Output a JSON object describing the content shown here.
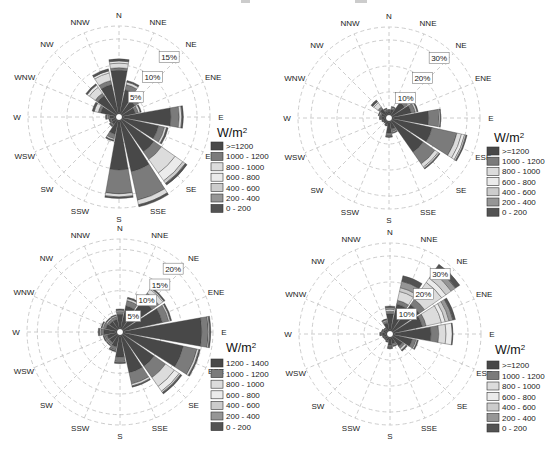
{
  "figure": {
    "width": 547,
    "height": 452,
    "background": "#ffffff"
  },
  "directions": [
    "N",
    "NNE",
    "NE",
    "ENE",
    "E",
    "ESE",
    "SE",
    "SSE",
    "S",
    "SSW",
    "SW",
    "WSW",
    "W",
    "WNW",
    "NW",
    "NNW"
  ],
  "style": {
    "bin_colors": [
      "#484848",
      "#7b7b7b",
      "#dcdcdc",
      "#ebebeb",
      "#cccccc",
      "#969696",
      "#535353"
    ],
    "grid_color": "#c6c6c6",
    "petal_stroke": "#3a3a3a",
    "text_color": "#222222",
    "ring_label_box_border": "#666666",
    "center_dot_fill": "#ffffff",
    "center_dot_stroke": "#333333"
  },
  "chart_data": [
    {
      "type": "windrose",
      "position": "top-left",
      "units": "W/m2",
      "center_px": [
        119,
        117
      ],
      "outer_radius_px": 91,
      "outer_pct": 17.5,
      "rings_pct": [
        5,
        10,
        15
      ],
      "ring_labels": [
        "5%",
        "10%",
        "15%"
      ],
      "ring_label_azimuth_deg": 40,
      "legend": {
        "title": "W/m",
        "title_sup": "2",
        "swatch_x": 211,
        "title_x": 217,
        "title_y": 137,
        "rows_y0": 146,
        "row_h": 10.4,
        "bins": [
          ">=1200",
          "1000 - 1200",
          "800 - 1000",
          "600 - 800",
          "400 - 600",
          "200 - 400",
          "0 - 200"
        ]
      },
      "petals_pct": {
        "N": [
          8.6,
          0.5,
          0.9,
          0.4,
          0,
          0,
          0.4
        ],
        "NNE": [
          5.0,
          1.0,
          0.5,
          0,
          0,
          0,
          0.3
        ],
        "NE": [
          3.4,
          0.8,
          0.6,
          0,
          0,
          0,
          0.3
        ],
        "ENE": [
          2.8,
          0.6,
          0.4,
          0,
          0,
          0,
          0.2
        ],
        "E": [
          9.6,
          1.6,
          0.5,
          0,
          0,
          0,
          0.3
        ],
        "ESE": [
          7.4,
          1.2,
          0.4,
          0,
          0,
          0,
          0.3
        ],
        "SE": [
          7.8,
          1.8,
          3.2,
          1.8,
          0.6,
          0,
          0.4
        ],
        "SSE": [
          10.4,
          5.6,
          0.9,
          0,
          0,
          0,
          0.4
        ],
        "S": [
          9.8,
          4.6,
          0.6,
          0,
          0,
          0,
          0.3
        ],
        "SSW": [
          3.0,
          0.9,
          0.3,
          0,
          0,
          0,
          0.2
        ],
        "SW": [
          1.3,
          0.4,
          0,
          0,
          0,
          0,
          0.2
        ],
        "WSW": [
          1.1,
          0.3,
          0,
          0,
          0,
          0,
          0.2
        ],
        "W": [
          1.4,
          0.4,
          0.2,
          0,
          0,
          0,
          0.2
        ],
        "WNW": [
          3.2,
          0.5,
          0.8,
          0,
          0,
          0,
          0.4
        ],
        "NW": [
          4.6,
          0.6,
          1.4,
          0.5,
          0,
          0,
          0.3
        ],
        "NNW": [
          6.0,
          0.8,
          1.5,
          0.4,
          0,
          0,
          0.4
        ]
      }
    },
    {
      "type": "windrose",
      "position": "top-right",
      "units": "W/m2",
      "center_px": [
        389,
        118
      ],
      "outer_radius_px": 91,
      "outer_pct": 35,
      "rings_pct": [
        10,
        20,
        30
      ],
      "ring_labels": [
        "10%",
        "20%",
        "30%"
      ],
      "ring_label_azimuth_deg": 40,
      "legend": {
        "title": "W/m",
        "title_sup": "2",
        "swatch_x": 487,
        "title_x": 494,
        "title_y": 142,
        "rows_y0": 151,
        "row_h": 10.2,
        "bins": [
          ">=1200",
          "1000 - 1200",
          "800 - 1000",
          "600 - 800",
          "400 - 600",
          "200 - 400",
          "0 - 200"
        ]
      },
      "petals_pct": {
        "N": [
          1.8,
          0.4,
          0,
          0,
          0,
          0,
          0.3
        ],
        "NNE": [
          2.6,
          0.6,
          0.3,
          0,
          0,
          0,
          0.3
        ],
        "NE": [
          6.5,
          1.5,
          1.0,
          0,
          0,
          0,
          0.5
        ],
        "ENE": [
          8.0,
          1.6,
          0.7,
          0,
          0,
          0,
          0.4
        ],
        "E": [
          14.5,
          4.0,
          0.5,
          0,
          0,
          0,
          0.2
        ],
        "ESE": [
          16.2,
          9.8,
          1.8,
          1.2,
          0.6,
          0,
          0.4
        ],
        "SE": [
          15.3,
          5.5,
          1.5,
          0.5,
          0,
          0,
          0.4
        ],
        "SSE": [
          3.6,
          1.0,
          0.4,
          0,
          0,
          0,
          0.3
        ],
        "S": [
          5.0,
          1.2,
          0.2,
          0,
          0,
          0,
          0.3
        ],
        "SSW": [
          1.7,
          0.4,
          0,
          0,
          0,
          0,
          0.3
        ],
        "SW": [
          1.3,
          0.3,
          0,
          0,
          0,
          0,
          0.2
        ],
        "WSW": [
          1.5,
          0.4,
          0,
          0,
          0,
          0,
          0.2
        ],
        "W": [
          1.9,
          0.5,
          0.2,
          0,
          0,
          0,
          0.3
        ],
        "WNW": [
          2.2,
          0.6,
          0.4,
          0,
          0,
          0,
          0.3
        ],
        "NW": [
          3.4,
          1.0,
          2.0,
          0.5,
          0,
          0,
          0.8
        ],
        "NNW": [
          2.0,
          0.5,
          0.3,
          0,
          0,
          0,
          0.3
        ]
      }
    },
    {
      "type": "windrose",
      "position": "bottom-left",
      "units": "W/m2",
      "center_px": [
        120,
        332
      ],
      "outer_radius_px": 93,
      "outer_pct": 22.5,
      "rings_pct": [
        5,
        10,
        15,
        20
      ],
      "ring_labels": [
        "5%",
        "10%",
        "15%",
        "20%"
      ],
      "ring_label_azimuth_deg": 40,
      "legend": {
        "title": "W/m",
        "title_sup": "2",
        "swatch_x": 211,
        "title_x": 226,
        "title_y": 352,
        "rows_y0": 363,
        "row_h": 10.6,
        "bins": [
          "1200 - 1400",
          "1000 - 1200",
          "800 - 1000",
          "600 - 800",
          "400 - 600",
          "200 - 400",
          "0 - 200"
        ]
      },
      "petals_pct": {
        "N": [
          3.8,
          0.7,
          0.3,
          0,
          0,
          0,
          0.3
        ],
        "NNE": [
          6.0,
          1.3,
          0.5,
          0,
          0,
          0,
          0.3
        ],
        "NE": [
          9.0,
          2.0,
          1.2,
          0.3,
          0,
          0,
          0.3
        ],
        "ENE": [
          10.0,
          1.6,
          0.4,
          0,
          0,
          0,
          0.3
        ],
        "E": [
          19.3,
          1.6,
          0.3,
          0,
          0,
          0,
          0.3
        ],
        "ESE": [
          15.2,
          3.4,
          0.5,
          0,
          0,
          0,
          0.3
        ],
        "SE": [
          9.6,
          3.4,
          2.6,
          1.4,
          0.4,
          0,
          0.4
        ],
        "SSE": [
          9.6,
          2.8,
          0.5,
          0,
          0,
          0,
          0.3
        ],
        "S": [
          5.6,
          1.1,
          0.2,
          0,
          0,
          0,
          0.3
        ],
        "SSW": [
          3.2,
          0.8,
          0.2,
          0,
          0,
          0,
          0.2
        ],
        "SW": [
          2.6,
          0.6,
          0.2,
          0,
          0,
          0,
          0.2
        ],
        "WSW": [
          2.7,
          0.6,
          0.2,
          0,
          0,
          0,
          0.2
        ],
        "W": [
          3.4,
          0.8,
          0.3,
          0,
          0,
          0,
          0.3
        ],
        "WNW": [
          3.0,
          0.7,
          0.3,
          0,
          0,
          0,
          0.2
        ],
        "NW": [
          2.6,
          0.6,
          0.3,
          0,
          0,
          0,
          0.2
        ],
        "NNW": [
          2.6,
          0.7,
          0.3,
          0,
          0,
          0,
          0.2
        ]
      }
    },
    {
      "type": "windrose",
      "position": "bottom-right",
      "units": "W/m2",
      "center_px": [
        390,
        334
      ],
      "outer_radius_px": 91,
      "outer_pct": 35,
      "rings_pct": [
        10,
        20,
        30
      ],
      "ring_labels": [
        "10%",
        "20%",
        "30%"
      ],
      "ring_label_azimuth_deg": 40,
      "legend": {
        "title": "W/m",
        "title_sup": "2",
        "swatch_x": 487,
        "title_x": 495,
        "title_y": 354,
        "rows_y0": 365,
        "row_h": 10.5,
        "bins": [
          ">=1200",
          "1000 - 1200",
          "800 - 1000",
          "600 - 800",
          "400 - 600",
          "200 - 400",
          "0 - 200"
        ]
      },
      "petals_pct": {
        "N": [
          7.0,
          1.0,
          0.8,
          0,
          0,
          0.7,
          0.5
        ],
        "NNE": [
          11.0,
          1.5,
          3.5,
          0,
          1.5,
          2.5,
          2.2
        ],
        "NE": [
          13.0,
          2.5,
          8.0,
          2.0,
          2.5,
          2.0,
          2.0
        ],
        "ENE": [
          12.0,
          1.5,
          6.0,
          1.5,
          1.5,
          1.5,
          1.0
        ],
        "E": [
          15.0,
          3.0,
          2.8,
          2.4,
          0,
          0,
          0.3
        ],
        "ESE": [
          8.0,
          1.5,
          0.5,
          0,
          0,
          0,
          0.4
        ],
        "SE": [
          5.0,
          1.0,
          0.8,
          0,
          0,
          0,
          0.5
        ],
        "SSE": [
          3.0,
          0.6,
          0.3,
          0,
          0,
          0,
          0.3
        ],
        "S": [
          3.6,
          0.7,
          0.2,
          0,
          0,
          0,
          0.4
        ],
        "SSW": [
          1.8,
          0.4,
          0,
          0,
          0,
          0,
          0.3
        ],
        "SW": [
          1.5,
          0.3,
          0,
          0,
          0,
          0,
          0.2
        ],
        "WSW": [
          1.6,
          0.4,
          0,
          0,
          0,
          0,
          0.2
        ],
        "W": [
          2.2,
          0.5,
          0.2,
          0,
          0,
          0,
          0.3
        ],
        "WNW": [
          1.8,
          0.4,
          0.2,
          0,
          0,
          0,
          0.2
        ],
        "NW": [
          1.6,
          0.4,
          0,
          0,
          0,
          0,
          0.2
        ],
        "NNW": [
          3.6,
          0.8,
          0.4,
          0,
          0,
          0,
          0.4
        ]
      }
    }
  ],
  "artifacts": [
    {
      "x": 241,
      "y": 0,
      "w": 9,
      "h": 3
    },
    {
      "x": 355,
      "y": 0,
      "w": 12,
      "h": 3
    }
  ]
}
